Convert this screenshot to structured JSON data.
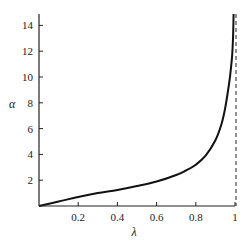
{
  "chart_data": {
    "type": "line",
    "title": "",
    "xlabel": "λ",
    "ylabel": "α",
    "xlim": [
      0,
      1
    ],
    "ylim": [
      0,
      15
    ],
    "grid": false,
    "legend": null,
    "x_ticks": [
      "0.2",
      "0.4",
      "0.6",
      "0.8",
      "1"
    ],
    "x_tick_values": [
      0.2,
      0.4,
      0.6,
      0.8,
      1.0
    ],
    "y_ticks": [
      "2",
      "4",
      "6",
      "8",
      "10",
      "12",
      "14"
    ],
    "y_tick_values": [
      2,
      4,
      6,
      8,
      10,
      12,
      14
    ],
    "series": [
      {
        "name": "alpha(lambda)",
        "style": "solid",
        "x": [
          0.0,
          0.1,
          0.2,
          0.3,
          0.4,
          0.5,
          0.6,
          0.7,
          0.75,
          0.8,
          0.85,
          0.9,
          0.93,
          0.95,
          0.97,
          0.98,
          0.985,
          0.99,
          0.993
        ],
        "y": [
          0.0,
          0.35,
          0.7,
          1.0,
          1.25,
          1.55,
          1.9,
          2.4,
          2.75,
          3.2,
          3.9,
          5.1,
          6.3,
          7.6,
          9.5,
          10.8,
          11.6,
          13.0,
          14.9
        ]
      }
    ],
    "annotations": [
      {
        "type": "vertical-asymptote",
        "x": 1.0,
        "style": "dashed"
      }
    ]
  }
}
